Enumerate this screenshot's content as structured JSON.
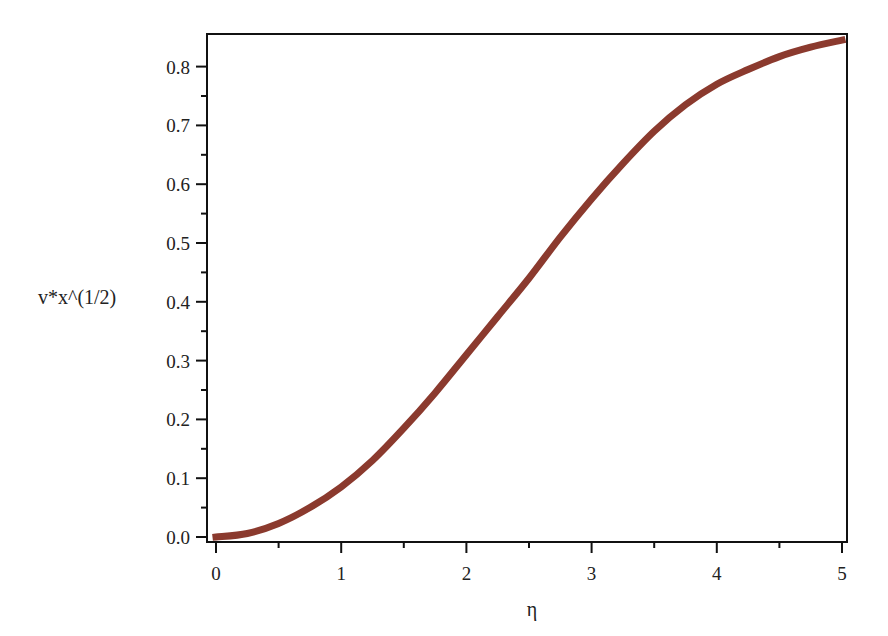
{
  "chart_data": {
    "type": "line",
    "title": "",
    "xlabel": "η",
    "ylabel": "v*x^(1/2)",
    "xlim": [
      0,
      5
    ],
    "ylim": [
      0,
      0.85
    ],
    "grid": false,
    "legend": null,
    "x_ticks": [
      "0",
      "1",
      "2",
      "3",
      "4",
      "5"
    ],
    "y_ticks": [
      "0.0",
      "0.1",
      "0.2",
      "0.3",
      "0.4",
      "0.5",
      "0.6",
      "0.7",
      "0.8"
    ],
    "series": [
      {
        "name": "v*x^(1/2)",
        "color": "#8b3a2e",
        "x": [
          0,
          0.25,
          0.5,
          0.75,
          1.0,
          1.25,
          1.5,
          1.75,
          2.0,
          2.25,
          2.5,
          2.75,
          3.0,
          3.25,
          3.5,
          3.75,
          4.0,
          4.25,
          4.5,
          4.75,
          5.0
        ],
        "y": [
          0.0,
          0.006,
          0.023,
          0.05,
          0.085,
          0.13,
          0.185,
          0.245,
          0.31,
          0.375,
          0.44,
          0.51,
          0.575,
          0.635,
          0.69,
          0.735,
          0.77,
          0.795,
          0.817,
          0.833,
          0.845
        ]
      }
    ]
  }
}
